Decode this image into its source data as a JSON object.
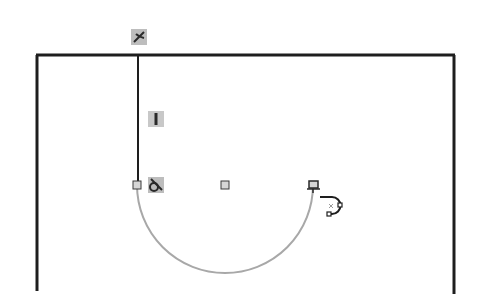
{
  "app": {
    "view": "sketch-canvas",
    "active_tool": "tangent-arc"
  },
  "sketch": {
    "colors": {
      "background": "#ffffff",
      "line": "#1e1e1e",
      "arc_preview": "#a8a8a8",
      "point_fill": "#d6d6d6",
      "point_stroke": "#3a3a3a",
      "badge_fill": "#bdbdbd"
    },
    "entities": {
      "top_line": {
        "x1": 37,
        "y1": 55,
        "x2": 454,
        "y2": 55
      },
      "left_line": {
        "x1": 37,
        "y1": 55,
        "x2": 37,
        "y2": 291
      },
      "right_line": {
        "x1": 454,
        "y1": 55,
        "x2": 454,
        "y2": 294
      },
      "vertical_line": {
        "x1": 138,
        "y1": 55,
        "x2": 138,
        "y2": 185
      },
      "arc": {
        "cx": 225,
        "cy": 185,
        "r": 88,
        "start": [
          137,
          185
        ],
        "end": [
          313,
          185
        ]
      }
    },
    "points": [
      {
        "name": "arc-start-point",
        "x": 137,
        "y": 185
      },
      {
        "name": "arc-center-point",
        "x": 225,
        "y": 185
      },
      {
        "name": "arc-end-point",
        "x": 313,
        "y": 185
      }
    ],
    "relations": [
      {
        "name": "coincident-relation-icon",
        "type": "coincident",
        "x": 131,
        "y": 29
      },
      {
        "name": "vertical-relation-icon",
        "type": "vertical",
        "x": 148,
        "y": 111
      },
      {
        "name": "tangent-relation-icon",
        "type": "tangent",
        "x": 148,
        "y": 177
      }
    ],
    "cursor": {
      "name": "tangent-arc-cursor-icon",
      "x": 320,
      "y": 193
    }
  }
}
